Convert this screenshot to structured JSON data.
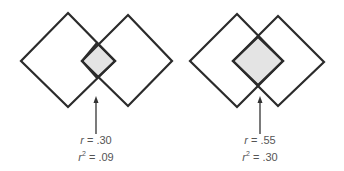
{
  "diagrams": [
    {
      "id": "left",
      "r_label": "r",
      "r_value": "= .30",
      "r2_label": "r",
      "r2_sup": "2",
      "r2_value": "= .09"
    },
    {
      "id": "right",
      "r_label": "r",
      "r_value": "= .55",
      "r2_label": "r",
      "r2_sup": "2",
      "r2_value": "= .30"
    }
  ],
  "colors": {
    "stroke": "#2b2b2b",
    "overlap_fill": "#e4e4e4",
    "text": "#555555"
  }
}
